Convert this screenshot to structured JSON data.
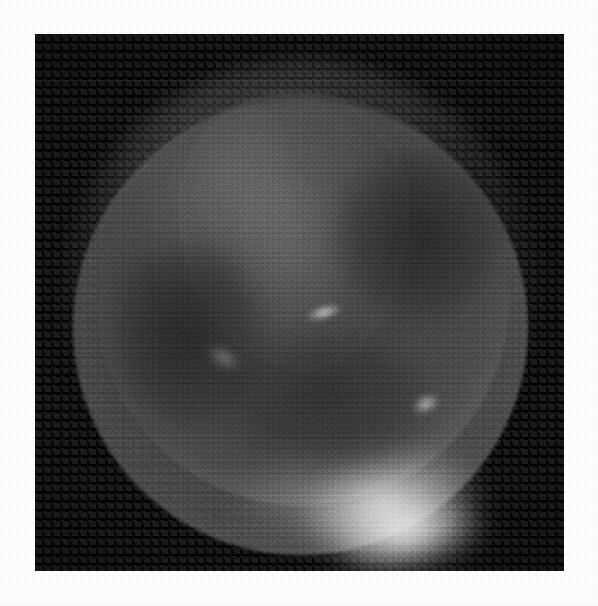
{
  "document": {
    "type": "micrograph-plate",
    "caption": "",
    "has_scale_bar": false,
    "has_annotations": false,
    "has_text": false
  },
  "plate": {
    "background_color": "#fdfdfd",
    "frame": {
      "x": 35,
      "y": 34,
      "width": 529,
      "height": 537,
      "fill_color": "#0b0b0b"
    }
  },
  "image": {
    "modality": "grayscale-micrograph",
    "subject": "spherical specimen with concentric translucent membranes",
    "field_background": "dark noisy field",
    "colors": {
      "background": "#0b0b0b",
      "membrane_mid": "#6b6b6b",
      "membrane_rim": "#b0b0b0",
      "specimen_body": "#4a4a4a",
      "highlight": "#ffffff",
      "page": "#fdfdfd"
    },
    "structures": [
      {
        "name": "outer-membrane",
        "label": "outer translucent shell",
        "center_x": 267,
        "center_y": 265,
        "radius": 235
      },
      {
        "name": "middle-membrane",
        "label": "middle translucent shell",
        "center_x": 265,
        "center_y": 293,
        "radius": 227
      },
      {
        "name": "inner-sphere",
        "label": "inner sphere",
        "center_x": 268,
        "center_y": 266,
        "radius": 206
      },
      {
        "name": "embryo-body",
        "label": "internal blob / embryo body",
        "center_x": 257,
        "center_y": 194,
        "radius": 120
      }
    ],
    "highlights": [
      {
        "name": "bottom-main-highlight",
        "x": 357,
        "y": 470,
        "intensity": 0.92
      },
      {
        "name": "bottom-second-highlight",
        "x": 375,
        "y": 501,
        "intensity": 0.95
      },
      {
        "name": "center-fleck",
        "x": 289,
        "y": 278,
        "intensity": 0.85
      },
      {
        "name": "right-fleck",
        "x": 391,
        "y": 370,
        "intensity": 0.78
      },
      {
        "name": "left-fleck",
        "x": 189,
        "y": 324,
        "intensity": 0.45
      }
    ]
  }
}
